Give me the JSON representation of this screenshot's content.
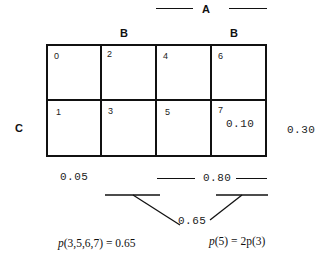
{
  "diagram": {
    "type": "karnaugh-map-probability",
    "variables": {
      "A": "A",
      "B_left": "B",
      "B_right": "B",
      "C": "C"
    },
    "cells": [
      {
        "index": "0",
        "row": 0,
        "col": 0
      },
      {
        "index": "2",
        "row": 0,
        "col": 1
      },
      {
        "index": "4",
        "row": 0,
        "col": 2
      },
      {
        "index": "6",
        "row": 0,
        "col": 3
      },
      {
        "index": "1",
        "row": 1,
        "col": 0
      },
      {
        "index": "3",
        "row": 1,
        "col": 1
      },
      {
        "index": "5",
        "row": 1,
        "col": 2
      },
      {
        "index": "7",
        "row": 1,
        "col": 3,
        "value": "0.10"
      }
    ],
    "annotations": {
      "c_row_prob": "0.30",
      "cell0_prob": "0.05",
      "a_cols_prob": "0.80",
      "merged_prob": "0.65"
    },
    "equations": {
      "left": "p(3,5,6,7) = 0.65",
      "right": "p(5) = 2p(3)"
    }
  },
  "colors": {
    "line": "#111111",
    "background": "#ffffff"
  }
}
